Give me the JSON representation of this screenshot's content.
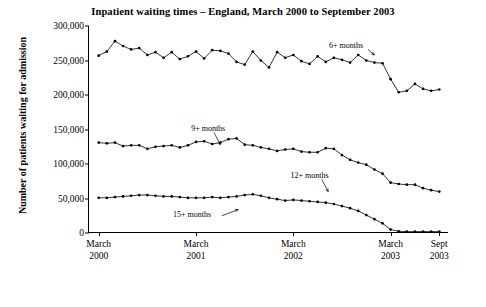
{
  "chart_data": {
    "type": "line",
    "title": "Inpatient waiting times – England, March 2000 to September 2003",
    "xlabel": "",
    "ylabel": "Number of patients waiting for admission",
    "ylim": [
      0,
      300000
    ],
    "yticks": [
      "0",
      "50,000",
      "100,000",
      "150,000",
      "200,000",
      "250,000",
      "300,000"
    ],
    "ytick_values": [
      0,
      50000,
      100000,
      150000,
      200000,
      250000,
      300000
    ],
    "grid": false,
    "legend_position": "inline-annotations",
    "xtick_labels": [
      {
        "line1": "March",
        "line2": "2000",
        "x": 0
      },
      {
        "line1": "March",
        "line2": "2001",
        "x": 12
      },
      {
        "line1": "March",
        "line2": "2002",
        "x": 24
      },
      {
        "line1": "March",
        "line2": "2003",
        "x": 36
      },
      {
        "line1": "Sept",
        "line2": "2003",
        "x": 42
      }
    ],
    "x": [
      0,
      1,
      2,
      3,
      4,
      5,
      6,
      7,
      8,
      9,
      10,
      11,
      12,
      13,
      14,
      15,
      16,
      17,
      18,
      19,
      20,
      21,
      22,
      23,
      24,
      25,
      26,
      27,
      28,
      29,
      30,
      31,
      32,
      33,
      34,
      35,
      36,
      37,
      38,
      39,
      40,
      41,
      42
    ],
    "annotations": [
      {
        "text": "6+ months",
        "x": 30.5,
        "y": 272000
      },
      {
        "text": "9+ months",
        "x": 13.5,
        "y": 152000
      },
      {
        "text": "12+ months",
        "x": 26.0,
        "y": 84000
      },
      {
        "text": "15+ months",
        "x": 11.5,
        "y": 27000
      }
    ],
    "annotation_arrows": [
      {
        "x1": 14.2,
        "y1": 146000,
        "x2": 15.0,
        "y2": 128000
      },
      {
        "x1": 27.5,
        "y1": 78000,
        "x2": 28.3,
        "y2": 60000
      },
      {
        "x1": 15.2,
        "y1": 25000,
        "x2": 17.2,
        "y2": 34000
      },
      {
        "x1": 33.2,
        "y1": 266000,
        "x2": 34.0,
        "y2": 258000
      }
    ],
    "series": [
      {
        "name": "6+ months",
        "values": [
          257000,
          263000,
          278000,
          271000,
          266000,
          268000,
          258000,
          262000,
          254000,
          262000,
          252000,
          256000,
          263000,
          253000,
          265000,
          264000,
          260000,
          248000,
          244000,
          263000,
          250000,
          240000,
          262000,
          254000,
          258000,
          249000,
          245000,
          256000,
          248000,
          254000,
          251000,
          247000,
          258000,
          250000,
          247000,
          246000,
          223000,
          204000,
          206000,
          216000,
          209000,
          206000,
          208000
        ]
      },
      {
        "name": "9+ months",
        "values": [
          131000,
          130000,
          131000,
          126000,
          127000,
          127000,
          122000,
          125000,
          126000,
          127000,
          124000,
          127000,
          132000,
          133000,
          129000,
          131000,
          136000,
          137000,
          128000,
          127000,
          124000,
          122000,
          119000,
          121000,
          122000,
          118000,
          117000,
          117000,
          123000,
          122000,
          113000,
          106000,
          102000,
          99000,
          92000,
          86000,
          73000,
          71000,
          70000,
          70000,
          65000,
          62000,
          60000
        ]
      },
      {
        "name": "12+ months",
        "values": [
          51000,
          51000,
          52000,
          53000,
          54000,
          55000,
          55000,
          54000,
          53000,
          53000,
          52000,
          51000,
          51000,
          51000,
          52000,
          51000,
          52000,
          53000,
          55000,
          56000,
          54000,
          51000,
          49000,
          47000,
          48000,
          47000,
          46000,
          45000,
          44000,
          42000,
          39000,
          36000,
          32000,
          26000,
          20000,
          14000,
          5000,
          2500,
          2000,
          2000,
          2000,
          2000,
          2000
        ]
      }
    ]
  }
}
